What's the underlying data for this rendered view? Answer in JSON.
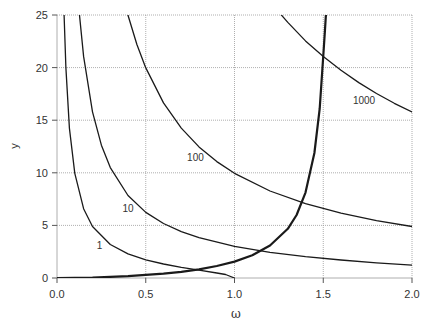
{
  "chart_data": {
    "type": "line",
    "title": "",
    "xlabel": "ω",
    "ylabel": "y",
    "xlim": [
      0,
      2
    ],
    "ylim": [
      0,
      25
    ],
    "xticks": [
      0.0,
      0.5,
      1.0,
      1.5,
      2.0
    ],
    "xtick_labels": [
      "0.0",
      "0.5",
      "1.0",
      "1.5",
      "2.0"
    ],
    "yticks": [
      0,
      5,
      10,
      15,
      20,
      25
    ],
    "ytick_labels": [
      "0",
      "5",
      "10",
      "15",
      "20",
      "25"
    ],
    "grid": true,
    "legend": null,
    "series": [
      {
        "name": "1",
        "formula": "sqrt(1 - ω^2) / ω",
        "label": "1",
        "label_at": [
          0.24,
          2.8
        ],
        "width": 1.3,
        "points": [
          [
            0.04,
            24.98
          ],
          [
            0.05,
            19.97
          ],
          [
            0.07,
            14.25
          ],
          [
            0.1,
            9.95
          ],
          [
            0.15,
            6.59
          ],
          [
            0.2,
            4.9
          ],
          [
            0.3,
            3.18
          ],
          [
            0.4,
            2.29
          ],
          [
            0.5,
            1.73
          ],
          [
            0.6,
            1.33
          ],
          [
            0.7,
            1.02
          ],
          [
            0.8,
            0.75
          ],
          [
            0.9,
            0.48
          ],
          [
            0.95,
            0.33
          ],
          [
            1.0,
            0.0
          ]
        ]
      },
      {
        "name": "10",
        "formula": "sqrt(10 - ω^2) / ω",
        "label": "10",
        "label_at": [
          0.4,
          6.3
        ],
        "width": 1.3,
        "points": [
          [
            0.126,
            25.08
          ],
          [
            0.15,
            21.06
          ],
          [
            0.2,
            15.8
          ],
          [
            0.25,
            12.62
          ],
          [
            0.3,
            10.49
          ],
          [
            0.4,
            7.84
          ],
          [
            0.5,
            6.24
          ],
          [
            0.6,
            5.18
          ],
          [
            0.7,
            4.41
          ],
          [
            0.8,
            3.83
          ],
          [
            1.0,
            3.0
          ],
          [
            1.2,
            2.43
          ],
          [
            1.4,
            2.02
          ],
          [
            1.6,
            1.71
          ],
          [
            1.8,
            1.44
          ],
          [
            2.0,
            1.22
          ]
        ]
      },
      {
        "name": "100",
        "formula": "sqrt(100 - ω^2) / ω",
        "label": "100",
        "label_at": [
          0.78,
          11.1
        ],
        "width": 1.3,
        "points": [
          [
            0.4,
            24.98
          ],
          [
            0.45,
            22.2
          ],
          [
            0.5,
            19.97
          ],
          [
            0.6,
            16.64
          ],
          [
            0.7,
            14.25
          ],
          [
            0.8,
            12.46
          ],
          [
            0.9,
            11.06
          ],
          [
            1.0,
            9.95
          ],
          [
            1.2,
            8.27
          ],
          [
            1.4,
            7.07
          ],
          [
            1.6,
            6.17
          ],
          [
            1.8,
            5.46
          ],
          [
            2.0,
            4.9
          ]
        ]
      },
      {
        "name": "1000",
        "formula": "sqrt(1000 - ω^2) / ω",
        "label": "1000",
        "label_at": [
          1.73,
          16.5
        ],
        "width": 1.3,
        "points": [
          [
            1.262,
            25.04
          ],
          [
            1.3,
            24.3
          ],
          [
            1.4,
            22.54
          ],
          [
            1.5,
            21.06
          ],
          [
            1.6,
            19.74
          ],
          [
            1.7,
            18.57
          ],
          [
            1.8,
            17.54
          ],
          [
            1.9,
            16.61
          ],
          [
            2.0,
            15.78
          ]
        ]
      },
      {
        "name": "ω·tan(ω)",
        "formula": "ω · tan(ω)",
        "label": "",
        "width": 2.2,
        "points": [
          [
            0.0,
            0.0
          ],
          [
            0.2,
            0.04
          ],
          [
            0.4,
            0.17
          ],
          [
            0.6,
            0.41
          ],
          [
            0.7,
            0.59
          ],
          [
            0.8,
            0.82
          ],
          [
            0.9,
            1.14
          ],
          [
            1.0,
            1.56
          ],
          [
            1.1,
            2.16
          ],
          [
            1.2,
            3.09
          ],
          [
            1.3,
            4.68
          ],
          [
            1.35,
            5.99
          ],
          [
            1.4,
            8.12
          ],
          [
            1.45,
            11.88
          ],
          [
            1.48,
            16.09
          ],
          [
            1.5,
            21.15
          ],
          [
            1.51,
            23.61
          ],
          [
            1.516,
            25.3
          ]
        ]
      }
    ]
  },
  "layout": {
    "plot_left": 57,
    "plot_right": 412,
    "plot_top": 15,
    "plot_bottom": 278,
    "grid_color": "#9a9a9a",
    "axis_color": "#555555",
    "curve_color": "#1a1a1a"
  }
}
